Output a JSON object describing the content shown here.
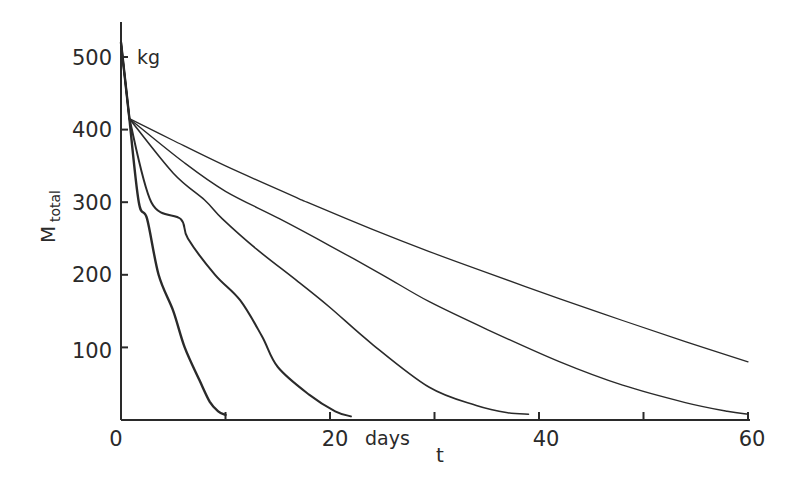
{
  "chart_data": {
    "type": "line",
    "title": "",
    "xlabel": "t",
    "xlabel_unit": "days",
    "ylabel": "M",
    "ylabel_subscript": "total",
    "ylabel_unit": "kg",
    "xlim": [
      0,
      60
    ],
    "ylim": [
      0,
      540
    ],
    "x_ticks": [
      0,
      10,
      20,
      30,
      40,
      50,
      60
    ],
    "x_tick_labels": [
      "0",
      "",
      "20",
      "",
      "40",
      "",
      "60"
    ],
    "y_ticks": [
      100,
      200,
      300,
      400,
      500
    ],
    "y_tick_labels": [
      "100",
      "200",
      "300",
      "400",
      "500"
    ],
    "grid": false,
    "legend": null,
    "initial_segment": {
      "description": "common steep drop shared by all curves",
      "x": [
        0,
        0.8
      ],
      "y": [
        520,
        415
      ]
    },
    "series": [
      {
        "name": "curve-1",
        "x": [
          0,
          0.8,
          1.7,
          2.5,
          3.6,
          5.0,
          6.1,
          7.5,
          8.5,
          9.3,
          10.0
        ],
        "y": [
          520,
          415,
          300,
          277,
          200,
          150,
          100,
          55,
          25,
          12,
          7
        ]
      },
      {
        "name": "curve-2",
        "x": [
          0,
          0.8,
          2.9,
          5.7,
          6.4,
          9.0,
          11.4,
          13.5,
          15.0,
          18.0,
          20.5,
          22.0
        ],
        "y": [
          520,
          415,
          300,
          277,
          250,
          200,
          165,
          115,
          73,
          35,
          12,
          5
        ]
      },
      {
        "name": "curve-3",
        "x": [
          0,
          0.8,
          5.0,
          8.0,
          9.7,
          13.0,
          17.0,
          20.0,
          24.0,
          29.5,
          34.0,
          37.0,
          39.0
        ],
        "y": [
          520,
          415,
          340,
          303,
          277,
          235,
          190,
          155,
          105,
          45,
          20,
          10,
          8
        ]
      },
      {
        "name": "curve-4",
        "x": [
          0,
          0.8,
          6.0,
          10.0,
          15.2,
          20.0,
          25.0,
          29.5,
          35.0,
          42.0,
          48.0,
          54.0,
          58.0,
          60.0
        ],
        "y": [
          520,
          415,
          355,
          315,
          277,
          240,
          200,
          163,
          125,
          80,
          48,
          24,
          12,
          8
        ]
      },
      {
        "name": "curve-5",
        "x": [
          0,
          0.8,
          5.0,
          10.0,
          17.0,
          17.8,
          24.0,
          29.5,
          35.0,
          42.0,
          48.0,
          54.0,
          60.0
        ],
        "y": [
          520,
          415,
          385,
          350,
          305,
          300,
          263,
          232,
          203,
          167,
          137,
          108,
          80
        ]
      }
    ]
  },
  "labels": {
    "y_unit": "kg",
    "y_title_main": "M",
    "y_title_sub": "total",
    "x_unit": "days",
    "x_title": "t",
    "x_ticks": [
      "0",
      "20",
      "40",
      "60"
    ],
    "y_ticks": [
      "500",
      "400",
      "300",
      "200",
      "100"
    ]
  }
}
